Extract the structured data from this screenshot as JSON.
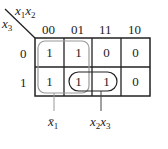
{
  "kmap": {
    "row_var": "x3",
    "col_vars": "x1x2",
    "col_var_1": "x",
    "col_var_1_sub": "1",
    "col_var_2": "x",
    "col_var_2_sub": "2",
    "row_var_name": "x",
    "row_var_sub": "3",
    "col_headers": [
      "00",
      "01",
      "11",
      "10"
    ],
    "row_headers": [
      "0",
      "1"
    ],
    "cells": [
      [
        "1",
        "1",
        "0",
        "0"
      ],
      [
        "1",
        "1",
        "1",
        "0"
      ]
    ],
    "groups": [
      {
        "label": "x̄1",
        "label_base": "x̄",
        "label_sub": "1",
        "cells": [
          [
            0,
            0
          ],
          [
            0,
            1
          ],
          [
            1,
            0
          ],
          [
            1,
            1
          ]
        ],
        "color": "#999999"
      },
      {
        "label": "x2x3",
        "label_a": "x",
        "label_a_sub": "2",
        "label_b": "x",
        "label_b_sub": "3",
        "cells": [
          [
            1,
            1
          ],
          [
            1,
            2
          ]
        ],
        "color": "#222222"
      }
    ]
  }
}
